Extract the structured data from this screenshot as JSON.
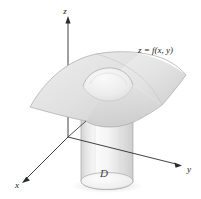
{
  "figure": {
    "background_color": "#ffffff",
    "width": 201,
    "height": 199
  },
  "axes": {
    "z": {
      "label": "z",
      "label_x": 68,
      "label_y": 13,
      "arrow": "up"
    },
    "y": {
      "label": "y",
      "label_x": 189,
      "label_y": 170,
      "arrow": "right"
    },
    "x": {
      "label": "x",
      "label_x": 17,
      "label_y": 186,
      "arrow": "down-left"
    },
    "origin_x": 68,
    "origin_y": 137,
    "line_color": "#2b2b2b"
  },
  "labels": {
    "function": "z = f(x, y)",
    "function_x": 138,
    "function_y": 52,
    "region": "ᴰ",
    "region_text": "D",
    "region_x": 104,
    "region_y": 176
  },
  "surface": {
    "name": "saddle-surface",
    "fill_light": "#f2f2f2",
    "fill_mid": "#e2e2e2",
    "fill_dark": "#cfcfcf",
    "outline_color": "#a8a8a8"
  },
  "cylinder": {
    "name": "vertical-cylinder",
    "fill_light": "#fbfbfb",
    "fill_mid": "#ececec",
    "fill_dark": "#d6d6d6",
    "outline_color": "#b5b5b5",
    "top_y": 70,
    "base_y": 181,
    "left_x": 81,
    "right_x": 133
  },
  "colors": {
    "ink": "#1a1a1a",
    "grey_line": "#a8a8a8",
    "shadow": "#ededed"
  }
}
